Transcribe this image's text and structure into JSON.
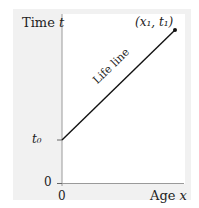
{
  "diagram": {
    "type": "spacetime-lifeline",
    "y_axis": {
      "label": "Time",
      "var": "t",
      "ticks": [
        "t0",
        "0"
      ]
    },
    "x_axis": {
      "label": "Age",
      "var": "x",
      "ticks": [
        "0"
      ]
    },
    "line": {
      "label": "Life line",
      "start": "(0, t0)",
      "end": "(x1, t1)"
    },
    "point_label": "(x₁, t₁)",
    "t0_label": "t₀",
    "zero_y": "0",
    "zero_x": "0",
    "colors": {
      "panel": "#f1f1f1",
      "plot": "#ffffff",
      "line": "#111111",
      "axis": "#999999"
    }
  },
  "labels": {
    "time": "Time",
    "time_var": "t",
    "age": "Age",
    "age_var": "x",
    "lifeline": "Life line",
    "point": "(x₁, t₁)",
    "t0": "t₀",
    "zero_y": "0",
    "zero_x": "0"
  }
}
